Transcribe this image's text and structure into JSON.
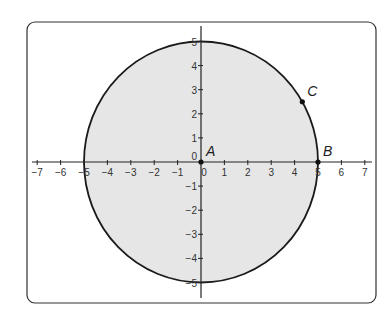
{
  "diagram": {
    "type": "coordinate-plane-circle",
    "x_axis": {
      "min": -7,
      "max": 7,
      "ticks": [
        -7,
        -6,
        -5,
        -4,
        -3,
        -2,
        -1,
        0,
        1,
        2,
        3,
        4,
        5,
        6,
        7
      ],
      "tick_labels": [
        "−7",
        "−6",
        "−5",
        "−4",
        "−3",
        "−2",
        "−1",
        "0",
        "1",
        "2",
        "3",
        "4",
        "5",
        "6",
        "7"
      ]
    },
    "y_axis": {
      "min": -5,
      "max": 5,
      "ticks": [
        5,
        4,
        3,
        2,
        1,
        0,
        -1,
        -2,
        -3,
        -4,
        -5
      ],
      "tick_labels": [
        "5",
        "4",
        "3",
        "2",
        "1",
        "0",
        "−1",
        "−2",
        "−3",
        "−4",
        "−5"
      ]
    },
    "circle": {
      "center": [
        0,
        0
      ],
      "radius": 5,
      "fill": "#e6e6e6",
      "stroke": "#1a1a1a"
    },
    "points": [
      {
        "label": "A",
        "x": 0,
        "y": 0
      },
      {
        "label": "B",
        "x": 5,
        "y": 0
      },
      {
        "label": "C",
        "x": 4.33,
        "y": 2.5
      }
    ],
    "colors": {
      "frame": "#333333",
      "axes": "#222222",
      "fill": "#e6e6e6"
    }
  }
}
